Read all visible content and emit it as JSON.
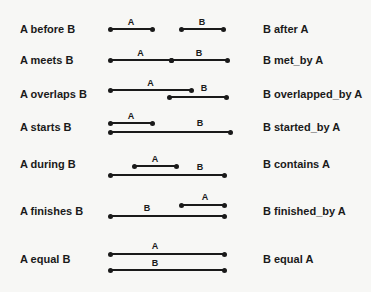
{
  "relations": [
    {
      "left": "A before B",
      "right": "B after A",
      "A": {
        "x1": 110,
        "x2": 152,
        "y": 29,
        "label": "A"
      },
      "B": {
        "x1": 181,
        "x2": 223,
        "y": 29,
        "label": "B"
      },
      "textY": 23
    },
    {
      "left": "A meets B",
      "right": "B met_by A",
      "A": {
        "x1": 110,
        "x2": 171,
        "y": 60,
        "label": "A"
      },
      "B": {
        "x1": 171,
        "x2": 227,
        "y": 60,
        "label": "B"
      },
      "textY": 54
    },
    {
      "left": "A overlaps B",
      "right": "B overlapped_by A",
      "A": {
        "x1": 110,
        "x2": 191,
        "y": 90,
        "label": "A"
      },
      "B": {
        "x1": 169,
        "x2": 226,
        "y": 97,
        "label": "B"
      },
      "textY": 88
    },
    {
      "left": "A starts B",
      "right": "B started_by A",
      "A": {
        "x1": 110,
        "x2": 152,
        "y": 123,
        "label": "A"
      },
      "B": {
        "x1": 110,
        "x2": 230,
        "y": 132,
        "label": "B"
      },
      "textY": 121
    },
    {
      "left": "A during B",
      "right": "B contains A",
      "A": {
        "x1": 134,
        "x2": 176,
        "y": 166,
        "label": "A"
      },
      "B": {
        "x1": 110,
        "x2": 224,
        "y": 175,
        "label": "B"
      },
      "textY": 158
    },
    {
      "left": "A finishes B",
      "right": "B finished_by A",
      "A": {
        "x1": 181,
        "x2": 224,
        "y": 205,
        "label": "A"
      },
      "B": {
        "x1": 110,
        "x2": 224,
        "y": 216,
        "label": "B"
      },
      "textY": 205
    },
    {
      "left": "A equal B",
      "right": "B equal A",
      "A": {
        "x1": 110,
        "x2": 224,
        "y": 254,
        "label": "A"
      },
      "B": {
        "x1": 110,
        "x2": 224,
        "y": 270,
        "label": "B"
      },
      "textY": 253
    }
  ],
  "colors": {
    "ink": "#1a1a1a",
    "background": "#f7f7f5"
  }
}
